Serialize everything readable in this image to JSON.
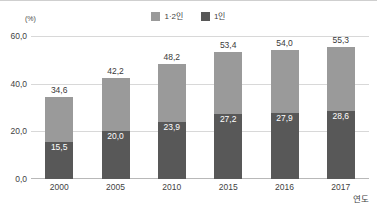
{
  "chart_data": {
    "type": "bar",
    "title": "",
    "subtitle": "",
    "xlabel": "연도",
    "ylabel": "",
    "unit_label": "(%)",
    "categories": [
      "2000",
      "2005",
      "2010",
      "2015",
      "2016",
      "2017"
    ],
    "series": [
      {
        "name": "1·2인",
        "color": "#9a9a9a",
        "values": [
          34.6,
          42.2,
          48.2,
          53.4,
          54.0,
          55.3
        ],
        "value_labels": [
          "34,6",
          "42,2",
          "48,2",
          "53,4",
          "54,0",
          "55,3"
        ]
      },
      {
        "name": "1인",
        "color": "#585858",
        "values": [
          15.5,
          20.0,
          23.9,
          27.2,
          27.9,
          28.6
        ],
        "value_labels": [
          "15,5",
          "20,0",
          "23,9",
          "27,2",
          "27,9",
          "28,6"
        ]
      }
    ],
    "ylim": [
      0,
      60
    ],
    "yticks": [
      0,
      20,
      40,
      60
    ],
    "ytick_labels": [
      "0,0",
      "20,0",
      "40,0",
      "60,0"
    ],
    "grid": true,
    "legend_position": "top-center",
    "overlap_style": "inner-bar"
  },
  "colors": {
    "series_light": "#9a9a9a",
    "series_dark": "#585858",
    "gridline": "#d8d8d8",
    "axis": "#b8b8b8",
    "text": "#3f3f3f",
    "value_label_on_bar": "#ffffff"
  }
}
